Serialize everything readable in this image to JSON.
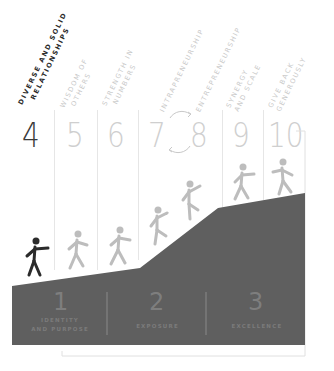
{
  "colors": {
    "hill": "#5f5f5f",
    "active_figure": "#2b2b2b",
    "faded_figure": "#bdbdbd",
    "grid_line": "#e6e6e6",
    "bracket": "#e0e0e0"
  },
  "steps": [
    {
      "number": "4",
      "label_line1": "DIVERSE AND SOLID",
      "label_line2": "RELATIONSHIPS",
      "active": true
    },
    {
      "number": "5",
      "label_line1": "WISDOM OF",
      "label_line2": "OTHERS",
      "active": false
    },
    {
      "number": "6",
      "label_line1": "STRENGTH IN",
      "label_line2": "NUMBERS",
      "active": false
    },
    {
      "number": "7",
      "label_line1": "INTRAPRENEURSHIP",
      "label_line2": "",
      "active": false
    },
    {
      "number": "8",
      "label_line1": "ENTREPRENEURSHIP",
      "label_line2": "",
      "active": false
    },
    {
      "number": "9",
      "label_line1": "SYNERGY",
      "label_line2": "AND SCALE",
      "active": false
    },
    {
      "number": "10",
      "label_line1": "GIVE BACK",
      "label_line2": "GENEROUSLY",
      "active": false
    }
  ],
  "cycle_icon": "circular-arrows-icon",
  "stages": [
    {
      "number": "1",
      "label_line1": "IDENTITY",
      "label_line2": "AND PURPOSE"
    },
    {
      "number": "2",
      "label_line1": "EXPOSURE",
      "label_line2": ""
    },
    {
      "number": "3",
      "label_line1": "EXCELLENCE",
      "label_line2": ""
    }
  ],
  "figures": [
    {
      "step": "4",
      "icon": "walking-person-icon",
      "active": true
    },
    {
      "step": "5",
      "icon": "walking-person-icon",
      "active": false
    },
    {
      "step": "6",
      "icon": "walking-person-icon",
      "active": false
    },
    {
      "step": "7",
      "icon": "climbing-person-icon",
      "active": false
    },
    {
      "step": "8",
      "icon": "climbing-person-icon",
      "active": false
    },
    {
      "step": "9",
      "icon": "walking-person-icon",
      "active": false
    },
    {
      "step": "10",
      "icon": "walking-person-icon",
      "active": false
    }
  ]
}
